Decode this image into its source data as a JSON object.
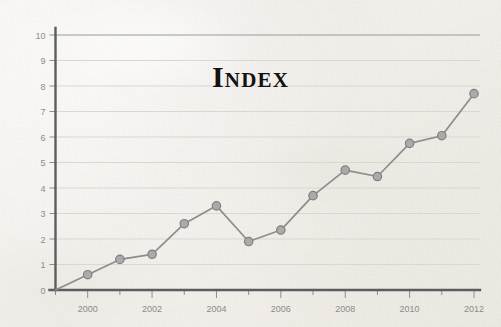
{
  "chart_data": {
    "type": "line",
    "title": "Index",
    "xlabel": "",
    "ylabel": "",
    "x": [
      1999,
      2000,
      2001,
      2002,
      2003,
      2004,
      2005,
      2006,
      2007,
      2008,
      2009,
      2010,
      2011,
      2012
    ],
    "values": [
      0,
      0.6,
      1.2,
      1.4,
      2.6,
      3.3,
      1.9,
      2.35,
      3.7,
      4.7,
      4.45,
      5.75,
      6.05,
      7.7
    ],
    "series": [
      {
        "name": "Index",
        "values": [
          0,
          0.6,
          1.2,
          1.4,
          2.6,
          3.3,
          1.9,
          2.35,
          3.7,
          4.7,
          4.45,
          5.75,
          6.05,
          7.7
        ]
      }
    ],
    "xlim": [
      1999,
      2012
    ],
    "ylim": [
      0,
      10
    ],
    "xticks": [
      1999,
      2000,
      2001,
      2002,
      2003,
      2004,
      2005,
      2006,
      2007,
      2008,
      2009,
      2010,
      2011,
      2012
    ],
    "xtick_labels": [
      "",
      "2000",
      "",
      "2002",
      "",
      "2004",
      "",
      "2006",
      "",
      "2008",
      "",
      "2010",
      "",
      "2012"
    ],
    "yticks": [
      0,
      1,
      2,
      3,
      4,
      5,
      6,
      7,
      8,
      9,
      10
    ],
    "ytick_labels": [
      "0",
      "1",
      "2",
      "3",
      "4",
      "5",
      "6",
      "7",
      "8",
      "9",
      "10"
    ],
    "grid": "horizontal",
    "legend": "none",
    "marker": "circle",
    "colors": {
      "line": "#8d8d8d",
      "marker_fill": "#aaaaaa",
      "marker_stroke": "#7f7f7f",
      "grid": "#d9d7d2",
      "axis": "#5d5d60",
      "tick_text": "#8b8b8b",
      "title": "#121212",
      "background": "#f2f0ec"
    }
  }
}
